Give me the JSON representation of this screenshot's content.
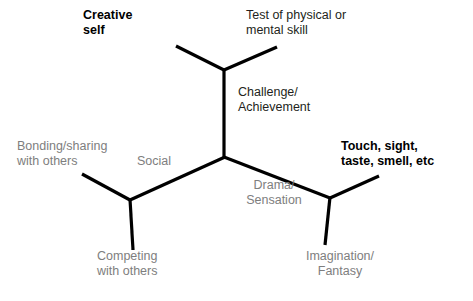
{
  "diagram": {
    "type": "branching-tree",
    "background_color": "#ffffff",
    "line_color": "#000000",
    "gray_text_color": "#7e7e7e",
    "dark_text_color": "#231f20",
    "nodes": [
      {
        "id": "creative-self",
        "label": "Creative\nself",
        "style": "bold",
        "position": "top-left"
      },
      {
        "id": "test-of-skill",
        "label": "Test of physical or\nmental skill",
        "style": "dark",
        "position": "top-right"
      },
      {
        "id": "challenge",
        "label": "Challenge/\nAchievement",
        "style": "dark",
        "position": "upper-center"
      },
      {
        "id": "bonding",
        "label": "Bonding/sharing\nwith others",
        "style": "gray",
        "position": "mid-left"
      },
      {
        "id": "social",
        "label": "Social",
        "style": "gray",
        "position": "center-left"
      },
      {
        "id": "senses",
        "label": "Touch, sight,\ntaste, smell, etc",
        "style": "bold",
        "position": "mid-right"
      },
      {
        "id": "drama",
        "label": "Drama/\nSensation",
        "style": "gray",
        "position": "center-right"
      },
      {
        "id": "competing",
        "label": "Competing\nwith others",
        "style": "gray",
        "position": "bottom-left"
      },
      {
        "id": "imagination",
        "label": "Imagination/\nFantasy",
        "style": "gray",
        "position": "bottom-right"
      }
    ],
    "edges": [
      {
        "id": "edge-top-left-arm",
        "from": [
          224,
          70
        ],
        "to": [
          176,
          46
        ]
      },
      {
        "id": "edge-top-right-arm",
        "from": [
          224,
          70
        ],
        "to": [
          277,
          47
        ]
      },
      {
        "id": "edge-trunk",
        "from": [
          224,
          70
        ],
        "to": [
          224,
          157
        ]
      },
      {
        "id": "edge-center-to-left",
        "from": [
          224,
          157
        ],
        "to": [
          130,
          200
        ]
      },
      {
        "id": "edge-center-to-right",
        "from": [
          224,
          157
        ],
        "to": [
          330,
          198
        ]
      },
      {
        "id": "edge-left-arm",
        "from": [
          130,
          200
        ],
        "to": [
          82,
          174
        ]
      },
      {
        "id": "edge-left-stem",
        "from": [
          130,
          200
        ],
        "to": [
          133,
          250
        ]
      },
      {
        "id": "edge-right-arm",
        "from": [
          330,
          198
        ],
        "to": [
          379,
          176
        ]
      },
      {
        "id": "edge-right-stem",
        "from": [
          330,
          198
        ],
        "to": [
          325,
          245
        ]
      }
    ]
  }
}
